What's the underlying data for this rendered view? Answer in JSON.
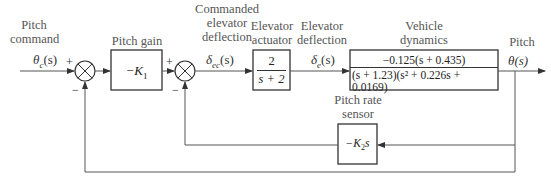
{
  "labels": {
    "pitch_command": [
      "Pitch",
      "command"
    ],
    "pitch_gain": "Pitch gain",
    "commanded_elevator_deflection": [
      "Commanded",
      "elevator",
      "deflection"
    ],
    "elevator_actuator": [
      "Elevator",
      "actuator"
    ],
    "elevator_deflection": [
      "Elevator",
      "deflection"
    ],
    "vehicle_dynamics": [
      "Vehicle",
      "dynamics"
    ],
    "pitch": "Pitch",
    "pitch_rate_sensor": [
      "Pitch rate",
      "sensor"
    ]
  },
  "signals": {
    "input": "θc(s)",
    "input_base": "θ",
    "input_sub": "c",
    "input_arg": "(s)",
    "commanded_deflection_base": "δ",
    "commanded_deflection_sub": "ec",
    "commanded_deflection_arg": "(s)",
    "deflection_base": "δ",
    "deflection_sub": "e",
    "deflection_arg": "(s)",
    "output": "θ(s)"
  },
  "summing_junctions": [
    {
      "id": "sum1",
      "plus": "+",
      "minus": "−"
    },
    {
      "id": "sum2",
      "plus": "+",
      "minus": "−"
    }
  ],
  "blocks": {
    "pitch_gain": "−K1",
    "pitch_gain_base": "−K",
    "pitch_gain_sub": "1",
    "elevator_actuator_num": "2",
    "elevator_actuator_den": "s + 2",
    "vehicle_dynamics_num": "−0.125(s + 0.435)",
    "vehicle_dynamics_den": "(s + 1.23)(s² + 0.226s + 0.0169)",
    "pitch_rate_sensor": "−K2s",
    "pitch_rate_sensor_base": "−K",
    "pitch_rate_sensor_sub": "2",
    "pitch_rate_sensor_s": "s"
  },
  "colors": {
    "line": "#555555",
    "box_border": "#333333",
    "text": "#333333"
  }
}
